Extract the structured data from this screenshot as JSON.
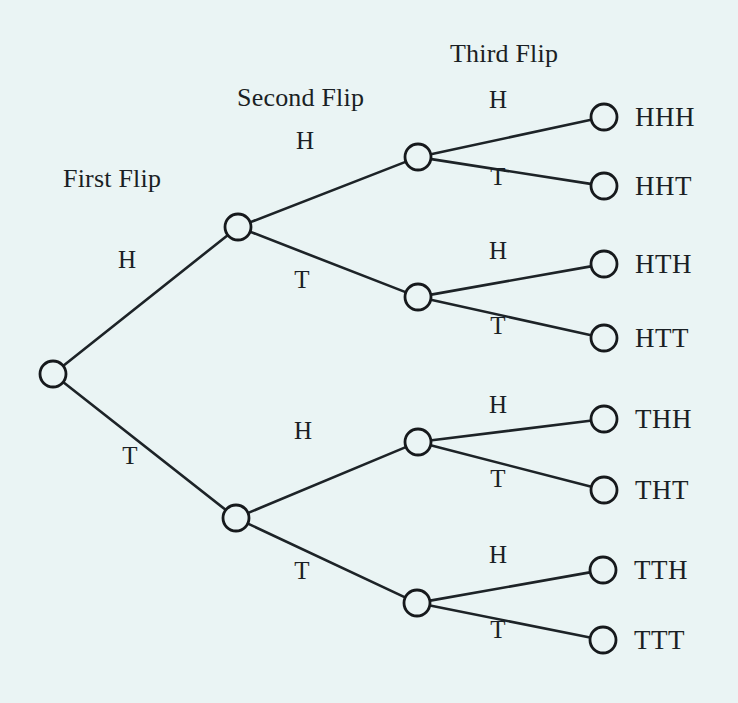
{
  "canvas": {
    "width": 738,
    "height": 703,
    "background": "#eaf4f4",
    "line_color": "#1d2327",
    "text_color": "#1a1f24"
  },
  "diagram": {
    "kind": "probability-tree",
    "stage_titles": [
      {
        "text": "First Flip",
        "x": 63,
        "y": 166
      },
      {
        "text": "Second Flip",
        "x": 237,
        "y": 85
      },
      {
        "text": "Third Flip",
        "x": 450,
        "y": 41
      }
    ],
    "nodes": [
      {
        "id": "root",
        "label": "",
        "x": 53,
        "y": 374,
        "r": 13
      },
      {
        "id": "H",
        "label": "",
        "x": 238,
        "y": 227,
        "r": 13
      },
      {
        "id": "T",
        "label": "",
        "x": 236,
        "y": 518,
        "r": 13
      },
      {
        "id": "HH",
        "label": "",
        "x": 418,
        "y": 157,
        "r": 13
      },
      {
        "id": "HT",
        "label": "",
        "x": 418,
        "y": 297,
        "r": 13
      },
      {
        "id": "TH",
        "label": "",
        "x": 418,
        "y": 442,
        "r": 13
      },
      {
        "id": "TT",
        "label": "",
        "x": 417,
        "y": 603,
        "r": 13
      },
      {
        "id": "HHH",
        "label": "HHH",
        "x": 604,
        "y": 117,
        "r": 13
      },
      {
        "id": "HHT",
        "label": "HHT",
        "x": 604,
        "y": 186,
        "r": 13
      },
      {
        "id": "HTH",
        "label": "HTH",
        "x": 604,
        "y": 264,
        "r": 13
      },
      {
        "id": "HTT",
        "label": "HTT",
        "x": 604,
        "y": 338,
        "r": 13
      },
      {
        "id": "THH",
        "label": "THH",
        "x": 604,
        "y": 419,
        "r": 13
      },
      {
        "id": "THT",
        "label": "THT",
        "x": 604,
        "y": 490,
        "r": 13
      },
      {
        "id": "TTH",
        "label": "TTH",
        "x": 603,
        "y": 570,
        "r": 13
      },
      {
        "id": "TTT",
        "label": "TTT",
        "x": 603,
        "y": 640,
        "r": 13
      }
    ],
    "edges": [
      {
        "from": "root",
        "to": "H",
        "label": "H",
        "lx": 127,
        "ly": 259
      },
      {
        "from": "root",
        "to": "T",
        "label": "T",
        "lx": 130,
        "ly": 455
      },
      {
        "from": "H",
        "to": "HH",
        "label": "H",
        "lx": 305,
        "ly": 140
      },
      {
        "from": "H",
        "to": "HT",
        "label": "T",
        "lx": 302,
        "ly": 279
      },
      {
        "from": "T",
        "to": "TH",
        "label": "H",
        "lx": 303,
        "ly": 430
      },
      {
        "from": "T",
        "to": "TT",
        "label": "T",
        "lx": 302,
        "ly": 570
      },
      {
        "from": "HH",
        "to": "HHH",
        "label": "H",
        "lx": 498,
        "ly": 99
      },
      {
        "from": "HH",
        "to": "HHT",
        "label": "T",
        "lx": 498,
        "ly": 176
      },
      {
        "from": "HT",
        "to": "HTH",
        "label": "H",
        "lx": 498,
        "ly": 250
      },
      {
        "from": "HT",
        "to": "HTT",
        "label": "T",
        "lx": 498,
        "ly": 325
      },
      {
        "from": "TH",
        "to": "THH",
        "label": "H",
        "lx": 498,
        "ly": 404
      },
      {
        "from": "TH",
        "to": "THT",
        "label": "T",
        "lx": 498,
        "ly": 478
      },
      {
        "from": "TT",
        "to": "TTH",
        "label": "H",
        "lx": 498,
        "ly": 554
      },
      {
        "from": "TT",
        "to": "TTT",
        "label": "T",
        "lx": 498,
        "ly": 629
      }
    ],
    "leaf_label_offset_x": 31,
    "outcomes": [
      "HHH",
      "HHT",
      "HTH",
      "HTT",
      "THH",
      "THT",
      "TTH",
      "TTT"
    ]
  }
}
